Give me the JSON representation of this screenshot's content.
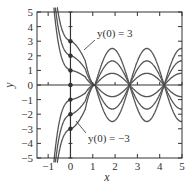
{
  "chart_data": {
    "type": "line",
    "title": "",
    "xlabel": "x",
    "ylabel": "y",
    "xlim": [
      -1.5,
      5
    ],
    "ylim": [
      -5,
      5
    ],
    "xticks": [
      -1,
      0,
      1,
      2,
      3,
      4,
      5
    ],
    "yticks": [
      -5,
      -4,
      -3,
      -2,
      -1,
      0,
      1,
      2,
      3,
      4,
      5
    ],
    "grid": false,
    "zero_axes": true,
    "initial_points": [
      {
        "x": 0,
        "y": 3
      },
      {
        "x": 0,
        "y": 2
      },
      {
        "x": 0,
        "y": 1
      },
      {
        "x": 0,
        "y": 0
      },
      {
        "x": 0,
        "y": -1
      },
      {
        "x": 0,
        "y": -2
      },
      {
        "x": 0,
        "y": -3
      }
    ],
    "series": [
      {
        "name": "y(0) = 3",
        "y0": 3,
        "amplitude": 2.5
      },
      {
        "name": "y(0) = 2",
        "y0": 2,
        "amplitude": 1.65
      },
      {
        "name": "y(0) = 1",
        "y0": 1,
        "amplitude": 0.8
      },
      {
        "name": "y(0) = -1",
        "y0": -1,
        "amplitude": -0.8
      },
      {
        "name": "y(0) = -2",
        "y0": -2,
        "amplitude": -1.65
      },
      {
        "name": "y(0) = -3",
        "y0": -3,
        "amplitude": -2.5
      }
    ],
    "common_zero_crossings_x": [
      1.1,
      2.65,
      4.2
    ],
    "annotations": [
      {
        "text": "y(0) = 3",
        "points_to_y0": 3
      },
      {
        "text": "y(0) = −3",
        "points_to_y0": -3
      }
    ],
    "colors": {
      "curve": "#555555",
      "axis": "#333333",
      "point": "#333333"
    }
  }
}
